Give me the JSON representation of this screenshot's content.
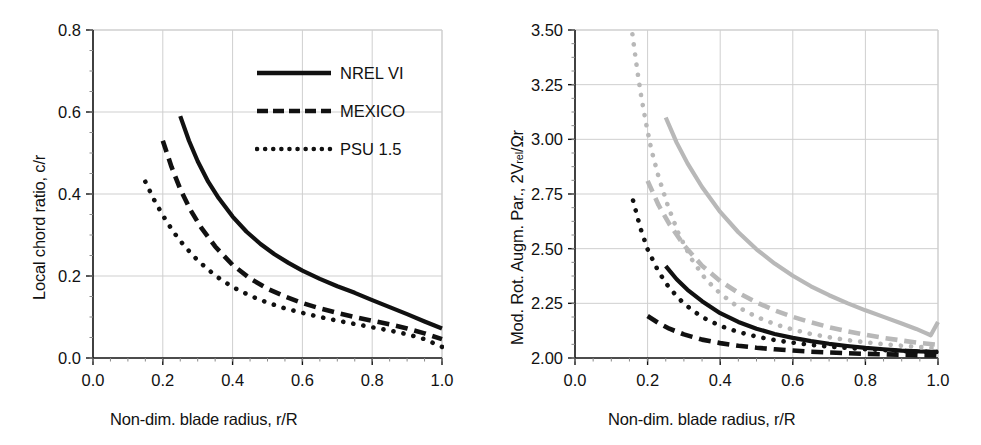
{
  "figure": {
    "panels": [
      "left",
      "right"
    ],
    "axis_color": "#111111",
    "grid_color": "#cfcfcf",
    "black_series_color": "#111111",
    "gray_series_color": "#b8b8b8"
  },
  "legend": {
    "items": [
      {
        "label": "NREL VI",
        "style": "solid",
        "key": "legend-key-solid"
      },
      {
        "label": "MEXICO",
        "style": "dashed",
        "key": "legend-key-dashed"
      },
      {
        "label": "PSU 1.5",
        "style": "dotted",
        "key": "legend-key-dotted"
      }
    ]
  },
  "chart_data": [
    {
      "id": "left",
      "type": "line",
      "title": "",
      "xlabel": "Non-dim. blade radius, r/R",
      "ylabel": "Local chord ratio, c/r",
      "ylabel_parts": {
        "main": "Local chord ratio, c/r",
        "sub": "",
        "tail": ""
      },
      "xlim": [
        0.0,
        1.0
      ],
      "ylim": [
        0.0,
        0.8
      ],
      "xticks": [
        "0.0",
        "0.2",
        "0.4",
        "0.6",
        "0.8",
        "1.0"
      ],
      "xtick_values": [
        0.0,
        0.2,
        0.4,
        0.6,
        0.8,
        1.0
      ],
      "yticks": [
        "0.0",
        "0.2",
        "0.4",
        "0.6",
        "0.8"
      ],
      "ytick_values": [
        0.0,
        0.2,
        0.4,
        0.6,
        0.8
      ],
      "minor_tick_step_x": 0.05,
      "minor_tick_step_y": 0.05,
      "grid": true,
      "legend_position": "top-right",
      "series": [
        {
          "name": "NREL VI",
          "style": "solid",
          "color": "#111111",
          "x": [
            0.25,
            0.275,
            0.3,
            0.33,
            0.36,
            0.4,
            0.44,
            0.48,
            0.52,
            0.56,
            0.6,
            0.65,
            0.7,
            0.75,
            0.8,
            0.85,
            0.9,
            0.95,
            1.0
          ],
          "y": [
            0.59,
            0.53,
            0.48,
            0.43,
            0.39,
            0.345,
            0.308,
            0.278,
            0.253,
            0.232,
            0.213,
            0.193,
            0.175,
            0.159,
            0.141,
            0.124,
            0.107,
            0.089,
            0.072
          ]
        },
        {
          "name": "MEXICO",
          "style": "dashed",
          "color": "#111111",
          "x": [
            0.2,
            0.225,
            0.25,
            0.28,
            0.31,
            0.35,
            0.4,
            0.45,
            0.5,
            0.55,
            0.6,
            0.65,
            0.7,
            0.75,
            0.8,
            0.85,
            0.9,
            0.95,
            1.0
          ],
          "y": [
            0.53,
            0.466,
            0.412,
            0.36,
            0.318,
            0.272,
            0.227,
            0.194,
            0.169,
            0.15,
            0.134,
            0.121,
            0.11,
            0.1,
            0.091,
            0.082,
            0.072,
            0.06,
            0.046
          ]
        },
        {
          "name": "PSU 1.5",
          "style": "dotted",
          "color": "#111111",
          "x": [
            0.15,
            0.175,
            0.2,
            0.23,
            0.26,
            0.3,
            0.35,
            0.4,
            0.45,
            0.5,
            0.55,
            0.6,
            0.65,
            0.7,
            0.75,
            0.8,
            0.85,
            0.9,
            0.95,
            1.0
          ],
          "y": [
            0.43,
            0.386,
            0.348,
            0.308,
            0.275,
            0.238,
            0.201,
            0.173,
            0.152,
            0.135,
            0.121,
            0.11,
            0.1,
            0.091,
            0.083,
            0.075,
            0.067,
            0.058,
            0.046,
            0.027
          ]
        }
      ]
    },
    {
      "id": "right",
      "type": "line",
      "title": "",
      "xlabel": "Non-dim. blade radius, r/R",
      "ylabel": "Mod. Rot. Augm. Par., 2Vrel/Ωr",
      "ylabel_parts": {
        "main": "Mod. Rot. Augm. Par., 2V",
        "sub": "rel",
        "tail": "/Ωr"
      },
      "xlim": [
        0.0,
        1.0
      ],
      "ylim": [
        2.0,
        3.5
      ],
      "xticks": [
        "0.0",
        "0.2",
        "0.4",
        "0.6",
        "0.8",
        "1.0"
      ],
      "xtick_values": [
        0.0,
        0.2,
        0.4,
        0.6,
        0.8,
        1.0
      ],
      "yticks": [
        "2.00",
        "2.25",
        "2.50",
        "2.75",
        "3.00",
        "3.25",
        "3.50"
      ],
      "ytick_values": [
        2.0,
        2.25,
        2.5,
        2.75,
        3.0,
        3.25,
        3.5
      ],
      "minor_tick_step_x": 0.05,
      "minor_tick_step_y": 0.0625,
      "grid": true,
      "legend_position": "none",
      "series": [
        {
          "name": "NREL VI (black)",
          "style": "solid",
          "color": "#111111",
          "x": [
            0.25,
            0.28,
            0.31,
            0.35,
            0.4,
            0.45,
            0.5,
            0.55,
            0.6,
            0.65,
            0.7,
            0.75,
            0.8,
            0.85,
            0.9,
            0.95,
            1.0
          ],
          "y": [
            2.42,
            2.36,
            2.312,
            2.26,
            2.205,
            2.165,
            2.134,
            2.11,
            2.092,
            2.077,
            2.065,
            2.055,
            2.046,
            2.04,
            2.034,
            2.03,
            2.028
          ]
        },
        {
          "name": "MEXICO (black)",
          "style": "dashed",
          "color": "#111111",
          "x": [
            0.2,
            0.23,
            0.26,
            0.3,
            0.35,
            0.4,
            0.45,
            0.5,
            0.55,
            0.6,
            0.65,
            0.7,
            0.75,
            0.8,
            0.85,
            0.9,
            0.95,
            1.0
          ],
          "y": [
            2.192,
            2.16,
            2.134,
            2.108,
            2.084,
            2.068,
            2.056,
            2.047,
            2.04,
            2.034,
            2.029,
            2.025,
            2.022,
            2.019,
            2.017,
            2.015,
            2.013,
            2.012
          ]
        },
        {
          "name": "PSU 1.5 (black)",
          "style": "dotted",
          "color": "#111111",
          "x": [
            0.16,
            0.18,
            0.2,
            0.23,
            0.26,
            0.3,
            0.35,
            0.4,
            0.45,
            0.5,
            0.55,
            0.6,
            0.65,
            0.7,
            0.75,
            0.8,
            0.85,
            0.9,
            0.95,
            1.0
          ],
          "y": [
            2.72,
            2.595,
            2.497,
            2.395,
            2.32,
            2.248,
            2.187,
            2.147,
            2.119,
            2.098,
            2.082,
            2.07,
            2.06,
            2.052,
            2.046,
            2.04,
            2.036,
            2.032,
            2.029,
            2.027
          ]
        },
        {
          "name": "NREL VI (gray)",
          "style": "solid",
          "color": "#b8b8b8",
          "x": [
            0.25,
            0.28,
            0.31,
            0.35,
            0.4,
            0.45,
            0.5,
            0.55,
            0.6,
            0.65,
            0.7,
            0.75,
            0.8,
            0.85,
            0.9,
            0.94,
            0.965,
            0.98,
            1.0
          ],
          "y": [
            3.1,
            2.985,
            2.89,
            2.782,
            2.668,
            2.575,
            2.497,
            2.432,
            2.376,
            2.328,
            2.287,
            2.251,
            2.218,
            2.188,
            2.158,
            2.133,
            2.115,
            2.104,
            2.165
          ]
        },
        {
          "name": "MEXICO (gray)",
          "style": "dashed",
          "color": "#b8b8b8",
          "x": [
            0.2,
            0.23,
            0.26,
            0.3,
            0.35,
            0.4,
            0.45,
            0.5,
            0.55,
            0.6,
            0.65,
            0.7,
            0.75,
            0.8,
            0.85,
            0.9,
            0.95,
            1.0
          ],
          "y": [
            2.81,
            2.7,
            2.612,
            2.516,
            2.422,
            2.352,
            2.298,
            2.254,
            2.218,
            2.188,
            2.163,
            2.141,
            2.122,
            2.106,
            2.092,
            2.08,
            2.069,
            2.06
          ]
        },
        {
          "name": "PSU 1.5 (gray)",
          "style": "dotted",
          "color": "#b8b8b8",
          "x": [
            0.148,
            0.155,
            0.163,
            0.172,
            0.182,
            0.195,
            0.21,
            0.23,
            0.255,
            0.285,
            0.32,
            0.36,
            0.4,
            0.45,
            0.5,
            0.55,
            0.6,
            0.65,
            0.7,
            0.75,
            0.8,
            0.85,
            0.9,
            0.95,
            1.0
          ],
          "y": [
            3.62,
            3.52,
            3.42,
            3.31,
            3.2,
            3.08,
            2.955,
            2.83,
            2.7,
            2.57,
            2.455,
            2.36,
            2.295,
            2.232,
            2.188,
            2.155,
            2.13,
            2.11,
            2.095,
            2.082,
            2.072,
            2.063,
            2.056,
            2.05,
            2.045
          ]
        }
      ]
    }
  ]
}
